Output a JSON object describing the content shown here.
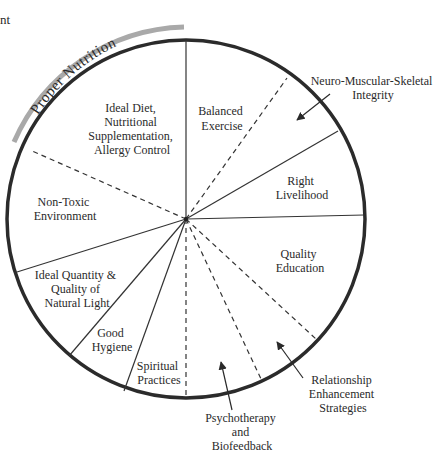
{
  "diagram": {
    "corner_fragment": "nt",
    "arc_label": "Proper Nutrition",
    "colors": {
      "circle": "#2b2b2b",
      "arc_highlight": "#a9a9a9",
      "lines": "#333333",
      "text": "#2a2a2a"
    },
    "segments": [
      {
        "lines": [
          "Ideal Diet,",
          "Nutritional",
          "Supplementation,",
          "Allergy Control"
        ]
      },
      {
        "lines": [
          "Balanced",
          "Exercise"
        ]
      },
      {
        "lines": [
          "Right",
          "Livelihood"
        ]
      },
      {
        "lines": [
          "Quality",
          "Education"
        ]
      },
      {
        "lines": [
          "Non-Toxic",
          "Environment"
        ]
      },
      {
        "lines": [
          "Ideal Quantity &",
          "Quality of",
          "Natural Light"
        ]
      },
      {
        "lines": [
          "Good",
          "Hygiene"
        ]
      },
      {
        "lines": [
          "Spiritual",
          "Practices"
        ]
      }
    ],
    "callouts": [
      {
        "lines": [
          "Neuro-Muscular-Skeletal",
          "Integrity"
        ]
      },
      {
        "lines": [
          "Relationship",
          "Enhancement",
          "Strategies"
        ]
      },
      {
        "lines": [
          "Psychotherapy",
          "and",
          "Biofeedback"
        ]
      }
    ]
  }
}
